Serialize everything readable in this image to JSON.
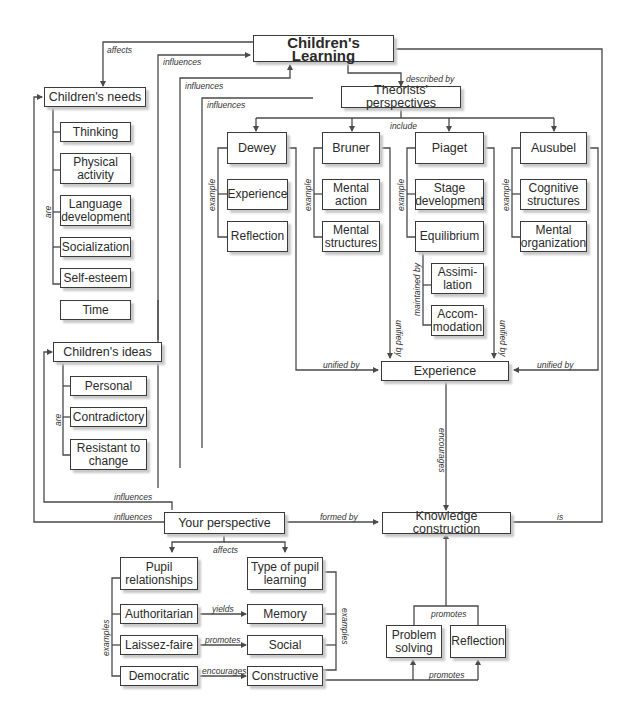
{
  "diagram": {
    "type": "concept-map",
    "central_concept": "Children's Learning",
    "nodes": {
      "childrens_learning": "Children's Learning",
      "theorists_perspectives": "Theorists' perspectives",
      "childrens_needs": "Children's needs",
      "needs_thinking": "Thinking",
      "needs_physical": "Physical activity",
      "needs_language": "Language development",
      "needs_socialization": "Socialization",
      "needs_self_esteem": "Self-esteem",
      "needs_time": "Time",
      "dewey": "Dewey",
      "dewey_experience": "Experience",
      "dewey_reflection": "Reflection",
      "bruner": "Bruner",
      "bruner_mental_action": "Mental action",
      "bruner_mental_structures": "Mental structures",
      "piaget": "Piaget",
      "piaget_stage": "Stage development",
      "piaget_equilibrium": "Equilibrium",
      "piaget_assimilation": "Assimi-lation",
      "piaget_accommodation": "Accom-modation",
      "ausubel": "Ausubel",
      "ausubel_cognitive": "Cognitive structures",
      "ausubel_mental_org": "Mental organization",
      "childrens_ideas": "Children's ideas",
      "ideas_personal": "Personal",
      "ideas_contradictory": "Contradictory",
      "ideas_resistant": "Resistant to change",
      "experience": "Experience",
      "your_perspective": "Your perspective",
      "knowledge_construction": "Knowledge construction",
      "pupil_relationships": "Pupil relationships",
      "type_pupil_learning": "Type of pupil learning",
      "authoritarian": "Authoritarian",
      "laissez_faire": "Laissez-faire",
      "democratic": "Democratic",
      "memory": "Memory",
      "social": "Social",
      "constructive": "Constructive",
      "problem_solving": "Problem solving",
      "reflection": "Reflection"
    },
    "link_labels": {
      "affects_needs": "affects",
      "influences_1": "influences",
      "influences_2": "influences",
      "influences_3": "influences",
      "described_by": "described by",
      "include": "include",
      "are_needs": "are",
      "example_dewey": "example",
      "example_bruner": "example",
      "example_piaget": "example",
      "example_ausubel": "example",
      "maintained_by": "maintained by",
      "unified_by_left": "unified by",
      "unified_by_right": "unified by",
      "unified_by_bruner": "unified by",
      "unified_by_piaget": "unified by",
      "are_ideas": "are",
      "encourages_exp": "encourages",
      "influences_ideas": "influences",
      "influences_needs": "influences",
      "formed_by": "formed by",
      "is": "is",
      "affects_pupil": "affects",
      "examples_left": "examples",
      "examples_right": "examples",
      "yields": "yields",
      "promotes_social": "promotes",
      "encourages_constructive": "encourages",
      "promotes_top": "promotes",
      "promotes_bottom": "promotes"
    },
    "colors": {
      "line": "#4a4a4a",
      "box_border": "#3a3a3a",
      "shadow": "#c8c8c8"
    }
  }
}
